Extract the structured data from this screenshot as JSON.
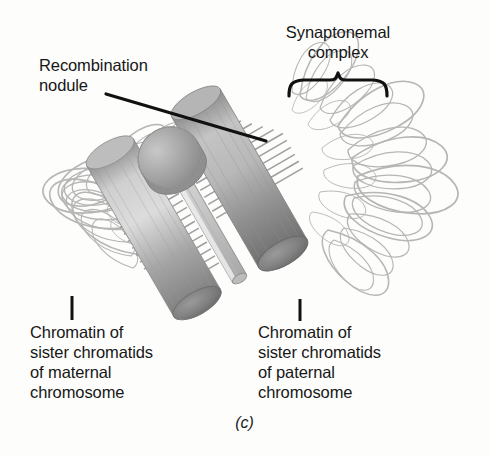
{
  "figure": {
    "caption": "(c)",
    "background_color": "#fdfdfc",
    "text_color": "#171717"
  },
  "labels": {
    "recombination_nodule": "Recombination\nnodule",
    "synaptonemal_complex": "Synaptonemal\ncomplex",
    "maternal_chromatin": "Chromatin of\nsister chromatids\nof maternal\nchromosome",
    "paternal_chromatin": "Chromatin of\nsister chromatids\nof paternal\nchromosome"
  },
  "diagram": {
    "colors": {
      "lateral_element": "#a9a9a9",
      "lateral_element_shade": "#8c8c8c",
      "lateral_element_highlight": "#d6d6d6",
      "end_cap_dark": "#7a7a7a",
      "nodule": "#a5a5a5",
      "nodule_shade": "#8a8a8a",
      "central_element": "#c4c4c4",
      "transverse_filament": "#909090",
      "chromatin_loop": "#b3b3b3",
      "leader_line": "#111111",
      "brace": "#111111"
    },
    "parts": [
      {
        "name": "lateral-element-maternal",
        "role": "left cylinder, axial core of maternal sister chromatids"
      },
      {
        "name": "lateral-element-paternal",
        "role": "right cylinder, axial core of paternal sister chromatids"
      },
      {
        "name": "central-element",
        "role": "thin ribbon running between the two lateral elements"
      },
      {
        "name": "transverse-filaments",
        "role": "ladder rungs linking lateral elements to central element"
      },
      {
        "name": "recombination-nodule",
        "role": "ellipsoid resting on the synaptonemal complex"
      },
      {
        "name": "chromatin-loops-maternal",
        "role": "loops radiating from left lateral element"
      },
      {
        "name": "chromatin-loops-paternal",
        "role": "loops radiating from right lateral element"
      }
    ]
  },
  "annotations": {
    "recombination_leader": "line from nodule label to the recombination nodule",
    "synaptonemal_brace": "curly brace spanning the synaptonemal complex",
    "maternal_tick": "vertical tick from maternal chromatin loops to its label",
    "paternal_tick": "vertical tick from paternal chromatin loops to its label"
  }
}
